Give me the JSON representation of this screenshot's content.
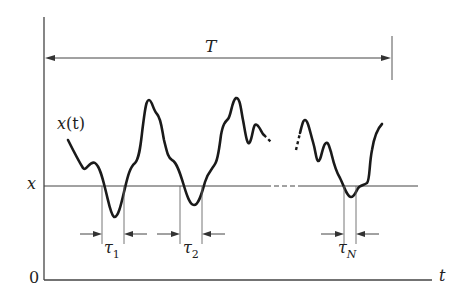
{
  "diagram": {
    "title_label": "T",
    "signal_label_var": "x",
    "signal_label_arg": "(t)",
    "threshold_label": "x",
    "origin_label": "0",
    "time_axis_label": "t",
    "durations": [
      {
        "symbol": "τ",
        "subscript": "1"
      },
      {
        "symbol": "τ",
        "subscript": "2"
      },
      {
        "symbol": "τ",
        "subscript": "N"
      }
    ],
    "colors": {
      "curve": "#1a1a1a",
      "lines": "#444444",
      "background": "#ffffff"
    }
  }
}
